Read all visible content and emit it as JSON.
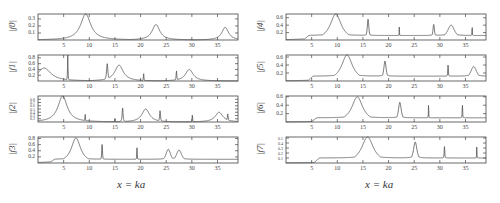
{
  "figure": {
    "left_column_xlabel": "x = ka",
    "right_column_xlabel": "x = ka"
  },
  "colors": {
    "line": "#555555",
    "frame": "#444444",
    "text": "#444444"
  },
  "chart_data": [
    {
      "type": "line",
      "title": "",
      "xlabel": "x = ka",
      "ylabel": "|f0|",
      "xlim": [
        0,
        39
      ],
      "ylim": [
        0,
        0.37
      ],
      "xticks": [
        5,
        10,
        15,
        20,
        25,
        30,
        35
      ],
      "yticks": [
        0.1,
        0.2,
        0.3
      ],
      "resonances": [
        {
          "x": 9.3,
          "height": 0.37,
          "width": 1.2
        },
        {
          "x": 23.0,
          "height": 0.22,
          "width": 0.9
        },
        {
          "x": 36.5,
          "height": 0.18,
          "width": 0.8
        }
      ],
      "baseline": 0.0
    },
    {
      "type": "line",
      "title": "",
      "xlabel": "x = ka",
      "ylabel": "|f1|",
      "xlim": [
        0,
        39
      ],
      "ylim": [
        0,
        0.9
      ],
      "xticks": [
        5,
        10,
        15,
        20,
        25,
        30,
        35
      ],
      "yticks": [
        0.2,
        0.4,
        0.6,
        0.8
      ],
      "resonances": [
        {
          "x": 1.2,
          "height": 0.45,
          "width": 1.6
        },
        {
          "x": 5.8,
          "height": 0.9,
          "width": 0.05
        },
        {
          "x": 13.5,
          "height": 0.6,
          "width": 0.15
        },
        {
          "x": 15.8,
          "height": 0.55,
          "width": 1.0
        },
        {
          "x": 20.6,
          "height": 0.3,
          "width": 0.05
        },
        {
          "x": 27.0,
          "height": 0.35,
          "width": 0.08
        },
        {
          "x": 29.5,
          "height": 0.4,
          "width": 0.9
        }
      ],
      "baseline": 0.0
    },
    {
      "type": "line",
      "title": "",
      "xlabel": "x = ka",
      "ylabel": "|f2|",
      "xlim": [
        0,
        39
      ],
      "ylim": [
        0.1,
        0.9
      ],
      "xticks": [
        5,
        10,
        15,
        20,
        25,
        30,
        35
      ],
      "yticks": [
        0.2,
        0.3,
        0.4,
        0.5,
        0.6,
        0.7,
        0.8
      ],
      "resonances": [
        {
          "x": 4.8,
          "height": 0.9,
          "width": 1.1
        },
        {
          "x": 9.2,
          "height": 0.35,
          "width": 0.05
        },
        {
          "x": 15.0,
          "height": 0.22,
          "width": 0.05
        },
        {
          "x": 16.5,
          "height": 0.55,
          "width": 0.1
        },
        {
          "x": 21.0,
          "height": 0.5,
          "width": 0.9
        },
        {
          "x": 23.8,
          "height": 0.45,
          "width": 0.1
        },
        {
          "x": 30.1,
          "height": 0.35,
          "width": 0.05
        },
        {
          "x": 35.3,
          "height": 0.4,
          "width": 0.9
        },
        {
          "x": 37.0,
          "height": 0.35,
          "width": 0.1
        }
      ],
      "baseline": 0.1
    },
    {
      "type": "line",
      "title": "",
      "xlabel": "x = ka",
      "ylabel": "|f3|",
      "xlim": [
        0,
        39
      ],
      "ylim": [
        0,
        0.85
      ],
      "xticks": [
        5,
        10,
        15,
        20,
        25,
        30,
        35
      ],
      "yticks": [
        0.2,
        0.4,
        0.6,
        0.8
      ],
      "resonances": [
        {
          "x": 7.4,
          "height": 0.82,
          "width": 1.1
        },
        {
          "x": 12.5,
          "height": 0.63,
          "width": 0.1
        },
        {
          "x": 19.3,
          "height": 0.5,
          "width": 0.07
        },
        {
          "x": 25.4,
          "height": 0.45,
          "width": 0.6
        },
        {
          "x": 27.5,
          "height": 0.42,
          "width": 0.7
        }
      ],
      "shoulder": {
        "start": 2.0,
        "level": 0.12
      },
      "baseline": 0.0
    },
    {
      "type": "line",
      "title": "",
      "xlabel": "x = ka",
      "ylabel": "|f4|",
      "xlim": [
        0,
        39
      ],
      "ylim": [
        0,
        0.7
      ],
      "xticks": [
        5,
        10,
        15,
        20,
        25,
        30,
        35
      ],
      "yticks": [
        0.2,
        0.4,
        0.6
      ],
      "resonances": [
        {
          "x": 9.7,
          "height": 0.7,
          "width": 1.3
        },
        {
          "x": 16.0,
          "height": 0.56,
          "width": 0.2
        },
        {
          "x": 22.1,
          "height": 0.45,
          "width": 0.03
        },
        {
          "x": 28.8,
          "height": 0.42,
          "width": 0.2
        },
        {
          "x": 32.2,
          "height": 0.4,
          "width": 0.9
        },
        {
          "x": 36.3,
          "height": 0.38,
          "width": 0.05
        }
      ],
      "shoulder": {
        "start": 3.2,
        "level": 0.12
      },
      "baseline": 0.0
    },
    {
      "type": "line",
      "title": "",
      "xlabel": "x = ka",
      "ylabel": "|f5|",
      "xlim": [
        0,
        39
      ],
      "ylim": [
        0,
        0.65
      ],
      "xticks": [
        5,
        10,
        15,
        20,
        25,
        30,
        35
      ],
      "yticks": [
        0.2,
        0.4,
        0.6
      ],
      "resonances": [
        {
          "x": 11.9,
          "height": 0.65,
          "width": 1.3
        },
        {
          "x": 19.3,
          "height": 0.5,
          "width": 0.3
        },
        {
          "x": 31.6,
          "height": 0.4,
          "width": 0.1
        },
        {
          "x": 36.6,
          "height": 0.36,
          "width": 0.8
        }
      ],
      "shoulder": {
        "start": 4.0,
        "level": 0.12
      },
      "baseline": 0.0
    },
    {
      "type": "line",
      "title": "",
      "xlabel": "x = ka",
      "ylabel": "|f6|",
      "xlim": [
        0,
        39
      ],
      "ylim": [
        0,
        0.62
      ],
      "xticks": [
        5,
        10,
        15,
        20,
        25,
        30,
        35
      ],
      "yticks": [
        0.2,
        0.4,
        0.6
      ],
      "resonances": [
        {
          "x": 13.9,
          "height": 0.6,
          "width": 1.3
        },
        {
          "x": 22.2,
          "height": 0.47,
          "width": 0.35
        },
        {
          "x": 27.8,
          "height": 0.42,
          "width": 0.05
        },
        {
          "x": 34.4,
          "height": 0.42,
          "width": 0.07
        }
      ],
      "shoulder": {
        "start": 4.7,
        "level": 0.1
      },
      "baseline": 0.0
    },
    {
      "type": "line",
      "title": "",
      "xlabel": "x = ka",
      "ylabel": "|f7|",
      "xlim": [
        0,
        39
      ],
      "ylim": [
        0,
        0.52
      ],
      "xticks": [
        5,
        10,
        15,
        20,
        25,
        30,
        35
      ],
      "yticks": [
        0.1,
        0.2,
        0.3,
        0.4,
        0.5
      ],
      "resonances": [
        {
          "x": 15.9,
          "height": 0.52,
          "width": 1.4
        },
        {
          "x": 25.2,
          "height": 0.42,
          "width": 0.45
        },
        {
          "x": 30.9,
          "height": 0.33,
          "width": 0.1
        },
        {
          "x": 37.2,
          "height": 0.32,
          "width": 0.05
        }
      ],
      "shoulder": {
        "start": 5.2,
        "level": 0.1
      },
      "baseline": 0.0
    }
  ]
}
